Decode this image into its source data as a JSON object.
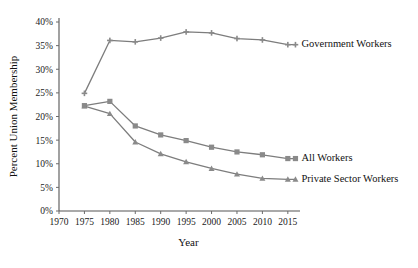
{
  "chart_data": {
    "type": "line",
    "title": "",
    "xlabel": "Year",
    "ylabel": "Percent Union Membership",
    "x": [
      1975,
      1980,
      1985,
      1990,
      1995,
      2000,
      2005,
      2010,
      2015
    ],
    "xlim": [
      1970,
      2017
    ],
    "ylim": [
      0,
      40
    ],
    "xticks": [
      1970,
      1975,
      1980,
      1985,
      1990,
      1995,
      2000,
      2005,
      2010,
      2015
    ],
    "xtick_labels": [
      "1970",
      "1975",
      "1980",
      "1985",
      "1990",
      "1995",
      "2000",
      "2005",
      "2010",
      "2015"
    ],
    "yticks": [
      0,
      5,
      10,
      15,
      20,
      25,
      30,
      35,
      40
    ],
    "ytick_labels": [
      "0%",
      "5%",
      "10%",
      "15%",
      "20%",
      "25%",
      "30%",
      "35%",
      "40%"
    ],
    "grid": false,
    "legend_position": "inline-right",
    "line_color": "#7d7d7d",
    "marker_color": "#8a8a8a",
    "axis_color": "#555555",
    "series": [
      {
        "name": "Government Workers",
        "label": "Government Workers",
        "marker": "plus",
        "values": [
          24.9,
          36.1,
          35.8,
          36.6,
          37.9,
          37.7,
          36.5,
          36.2,
          35.2
        ],
        "label_x": 2016.5,
        "label_y": 35.2
      },
      {
        "name": "All Workers",
        "label": "All Workers",
        "marker": "square",
        "values": [
          22.3,
          23.2,
          18.0,
          16.1,
          14.9,
          13.5,
          12.5,
          11.9,
          11.1
        ],
        "label_x": 2016.5,
        "label_y": 11.1
      },
      {
        "name": "Private Sector Workers",
        "label": "Private Sector Workers",
        "marker": "triangle",
        "values": [
          22.2,
          20.6,
          14.6,
          12.1,
          10.4,
          9.0,
          7.8,
          6.9,
          6.7
        ],
        "label_x": 2016.5,
        "label_y": 6.7
      }
    ]
  }
}
